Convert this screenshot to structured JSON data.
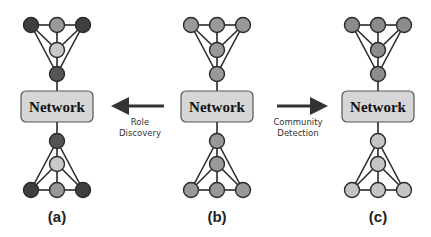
{
  "figure": {
    "panels": [
      {
        "id": "a",
        "label": "(a)",
        "cx": 57,
        "box_text": "Network",
        "top_group": {
          "top_row": [
            "#3f3f3f",
            "#999999",
            "#3f3f3f"
          ],
          "middle": "#c8c8c8",
          "apex": "#555555"
        },
        "bottom_group": {
          "apex": "#555555",
          "middle": "#c8c8c8",
          "bottom_row": [
            "#3f3f3f",
            "#999999",
            "#3f3f3f"
          ]
        }
      },
      {
        "id": "b",
        "label": "(b)",
        "cx": 217,
        "box_text": "Network",
        "top_group": {
          "top_row": [
            "#999999",
            "#999999",
            "#999999"
          ],
          "middle": "#999999",
          "apex": "#999999"
        },
        "bottom_group": {
          "apex": "#999999",
          "middle": "#999999",
          "bottom_row": [
            "#999999",
            "#999999",
            "#999999"
          ]
        }
      },
      {
        "id": "c",
        "label": "(c)",
        "cx": 378,
        "box_text": "Network",
        "top_group": {
          "top_row": [
            "#8c8c8c",
            "#8c8c8c",
            "#8c8c8c"
          ],
          "middle": "#8c8c8c",
          "apex": "#8c8c8c"
        },
        "bottom_group": {
          "apex": "#c4c4c4",
          "middle": "#c4c4c4",
          "bottom_row": [
            "#c4c4c4",
            "#c4c4c4",
            "#c4c4c4"
          ]
        }
      }
    ],
    "arrows": [
      {
        "direction": "left",
        "line1": "Role",
        "line2": "Discovery"
      },
      {
        "direction": "right",
        "line1": "Community",
        "line2": "Detection"
      }
    ]
  }
}
